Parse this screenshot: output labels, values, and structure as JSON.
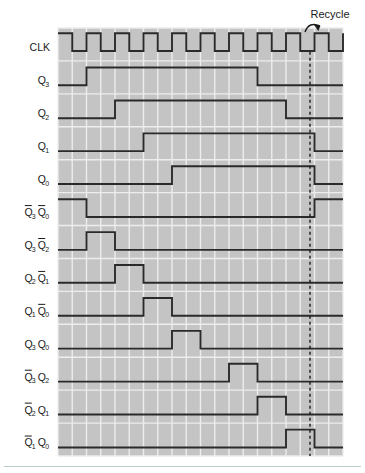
{
  "figure": {
    "title_annotation": "Recycle",
    "background_color": "#ffffff",
    "plot_background_color": "#c4c4c4",
    "grid_color": "#ededed",
    "waveform_color": "#2a2a2a",
    "dashed_marker_color": "#1a1a1a",
    "plot": {
      "x": 58,
      "y": 28,
      "width": 285,
      "height": 428
    },
    "grid": {
      "columns": 20,
      "cell_width": 14.25,
      "rows": 12,
      "row_height": 35.6
    },
    "recycle_marker_x": 310
  },
  "chart_data": {
    "type": "line",
    "xlabel": "",
    "ylabel": "",
    "grid": true,
    "legend_position": "left-axis-labels",
    "x_unit": "clock cell",
    "x_range": [
      0,
      20
    ],
    "clock_cycles": 10,
    "annotations": [
      {
        "text": "Recycle",
        "x": 330,
        "y": 18,
        "arrow_to_x": 312,
        "arrow_to_y": 33
      },
      {
        "type": "dashed-vertical",
        "x_cell": 18,
        "label": "recycle-edge"
      }
    ],
    "signals": [
      {
        "name": "CLK",
        "label_main": "CLK",
        "label_sub": "",
        "label_main_overbar": false,
        "row": 0,
        "waveform": "clock",
        "pulses": 10,
        "start_level": 1,
        "transitions_cells": [
          0,
          1,
          2,
          3,
          4,
          5,
          6,
          7,
          8,
          9,
          10,
          11,
          12,
          13,
          14,
          15,
          16,
          17,
          18,
          19,
          20
        ]
      },
      {
        "name": "Q3",
        "label_main": "Q",
        "label_sub": "3",
        "label_main_overbar": false,
        "row": 1,
        "waveform": "pulse",
        "start_level": 0,
        "transitions_cells": [
          2,
          14
        ]
      },
      {
        "name": "Q2",
        "label_main": "Q",
        "label_sub": "2",
        "label_main_overbar": false,
        "row": 2,
        "waveform": "pulse",
        "start_level": 0,
        "transitions_cells": [
          4,
          16
        ]
      },
      {
        "name": "Q1",
        "label_main": "Q",
        "label_sub": "1",
        "label_main_overbar": false,
        "row": 3,
        "waveform": "pulse",
        "start_level": 0,
        "transitions_cells": [
          6,
          18
        ]
      },
      {
        "name": "Q0",
        "label_main": "Q",
        "label_sub": "0",
        "label_main_overbar": false,
        "row": 4,
        "waveform": "pulse",
        "start_level": 0,
        "transitions_cells": [
          8,
          18
        ]
      },
      {
        "name": "Q3bar-Q0bar",
        "label_main": "Q",
        "label_sub": "3",
        "label_main_overbar": true,
        "label_main2": "Q",
        "label_sub2": "0",
        "label_main2_overbar": true,
        "row": 5,
        "waveform": "pulse",
        "start_level": 1,
        "transitions_cells": [
          2,
          18
        ]
      },
      {
        "name": "Q3-Q2bar",
        "label_main": "Q",
        "label_sub": "3",
        "label_main_overbar": false,
        "label_main2": "Q",
        "label_sub2": "2",
        "label_main2_overbar": true,
        "row": 6,
        "waveform": "pulse",
        "start_level": 0,
        "transitions_cells": [
          2,
          4
        ]
      },
      {
        "name": "Q2-Q1bar",
        "label_main": "Q",
        "label_sub": "2",
        "label_main_overbar": false,
        "label_main2": "Q",
        "label_sub2": "1",
        "label_main2_overbar": true,
        "row": 7,
        "waveform": "pulse",
        "start_level": 0,
        "transitions_cells": [
          4,
          6
        ]
      },
      {
        "name": "Q1-Q0bar",
        "label_main": "Q",
        "label_sub": "1",
        "label_main_overbar": false,
        "label_main2": "Q",
        "label_sub2": "0",
        "label_main2_overbar": true,
        "row": 8,
        "waveform": "pulse",
        "start_level": 0,
        "transitions_cells": [
          6,
          8
        ]
      },
      {
        "name": "Q3-Q0",
        "label_main": "Q",
        "label_sub": "3",
        "label_main_overbar": false,
        "label_main2": "Q",
        "label_sub2": "0",
        "label_main2_overbar": false,
        "row": 9,
        "waveform": "pulse",
        "start_level": 0,
        "transitions_cells": [
          8,
          10
        ]
      },
      {
        "name": "Q3bar-Q2",
        "label_main": "Q",
        "label_sub": "3",
        "label_main_overbar": true,
        "label_main2": "Q",
        "label_sub2": "2",
        "label_main2_overbar": false,
        "row": 10,
        "waveform": "pulse",
        "start_level": 0,
        "transitions_cells": [
          12,
          14
        ]
      },
      {
        "name": "Q2bar-Q1",
        "label_main": "Q",
        "label_sub": "2",
        "label_main_overbar": true,
        "label_main2": "Q",
        "label_sub2": "1",
        "label_main2_overbar": false,
        "row": 11,
        "waveform": "pulse",
        "start_level": 0,
        "transitions_cells": [
          14,
          16
        ]
      },
      {
        "name": "Q1bar-Q0",
        "label_main": "Q",
        "label_sub": "1",
        "label_main_overbar": true,
        "label_main2": "Q",
        "label_sub2": "0",
        "label_main2_overbar": false,
        "row": 12,
        "waveform": "pulse",
        "start_level": 0,
        "transitions_cells": [
          16,
          18
        ]
      }
    ]
  }
}
